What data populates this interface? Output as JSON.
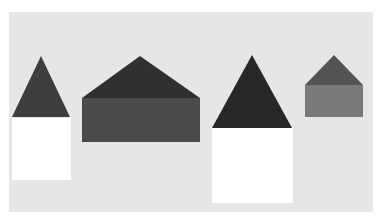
{
  "figure": {
    "background_color": "#ffffff",
    "panel_color": "#e6e6e6",
    "faint_title": "",
    "shapes": [
      {
        "name": "house-1",
        "roof": {
          "points": "41,56 12,117 70,117",
          "color": "#3d3d3d"
        },
        "body": {
          "x": 12,
          "y": 118,
          "width": 59,
          "height": 62,
          "color": "#ffffff"
        }
      },
      {
        "name": "house-2",
        "roof": {
          "points": "140,56 82,98 200,98",
          "color": "#303030"
        },
        "body": {
          "x": 82,
          "y": 98,
          "width": 118,
          "height": 44,
          "color": "#4a4a4a"
        }
      },
      {
        "name": "house-3",
        "roof": {
          "points": "252,55 212,128 292,128",
          "color": "#282828"
        },
        "body": {
          "x": 212,
          "y": 128,
          "width": 81,
          "height": 75,
          "color": "#ffffff"
        }
      },
      {
        "name": "house-4",
        "roof": {
          "points": "334,55 305,85 363,85",
          "color": "#545454"
        },
        "body": {
          "x": 305,
          "y": 85,
          "width": 58,
          "height": 32,
          "color": "#7a7a7a"
        }
      }
    ]
  }
}
